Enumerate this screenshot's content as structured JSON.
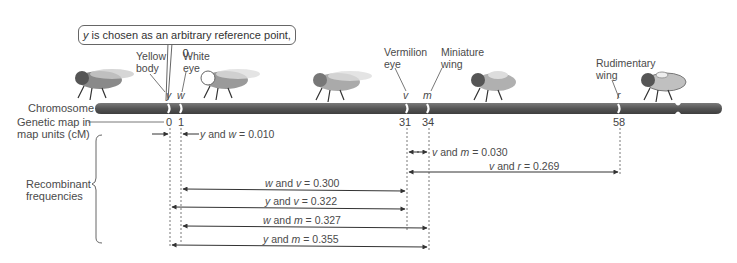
{
  "callout": {
    "var": "y",
    "text": " is chosen as an arbitrary reference point, 0."
  },
  "row_labels": {
    "chromosome": "Chromosome",
    "genetic_map_line1": "Genetic map in",
    "genetic_map_line2": "map units (cM)",
    "recombinant_line1": "Recombinant",
    "recombinant_line2": "frequencies"
  },
  "genes": [
    {
      "symbol": "y",
      "name_line1": "Yellow",
      "name_line2": "body",
      "position": "0"
    },
    {
      "symbol": "w",
      "name_line1": "White",
      "name_line2": "eye",
      "position": "1"
    },
    {
      "symbol": "v",
      "name_line1": "Vermilion",
      "name_line2": "eye",
      "position": "31"
    },
    {
      "symbol": "m",
      "name_line1": "Miniature",
      "name_line2": "wing",
      "position": "34"
    },
    {
      "symbol": "r",
      "name_line1": "Rudimentary",
      "name_line2": "wing",
      "position": "58"
    }
  ],
  "frequencies": [
    {
      "a": "y",
      "b": "w",
      "value": "0.010"
    },
    {
      "a": "v",
      "b": "m",
      "value": "0.030"
    },
    {
      "a": "v",
      "b": "r",
      "value": "0.269"
    },
    {
      "a": "w",
      "b": "v",
      "value": "0.300"
    },
    {
      "a": "y",
      "b": "v",
      "value": "0.322"
    },
    {
      "a": "w",
      "b": "m",
      "value": "0.327"
    },
    {
      "a": "y",
      "b": "m",
      "value": "0.355"
    }
  ],
  "text": {
    "and": " and ",
    "eq": " = "
  },
  "colors": {
    "chromosome": "#5a5a5a",
    "band": "#ffffff",
    "line": "#333333"
  }
}
